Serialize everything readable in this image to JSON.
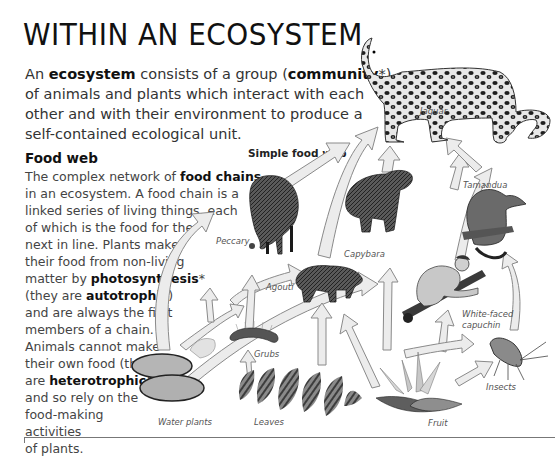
{
  "page": {
    "title": "WITHIN AN ECOSYSTEM",
    "intro": {
      "parts": [
        {
          "text": "An ",
          "bold": false
        },
        {
          "text": "ecosystem",
          "bold": true
        },
        {
          "text": " consists of a group (",
          "bold": false
        },
        {
          "text": "community",
          "bold": true
        },
        {
          "text": "*) of animals and plants which interact with each other and with their environment to produce a self-contained ecological unit.",
          "bold": false
        }
      ],
      "lines": [
        [
          "An ",
          "ecosystem",
          " consists of a group (",
          "community",
          "*)"
        ],
        [
          "of animals and plants which interact with each"
        ],
        [
          "other and with their environment to produce a"
        ],
        [
          "self-contained ecological unit."
        ]
      ]
    },
    "food_web_section": {
      "heading": "Food web",
      "lines": [
        [
          "The complex network of ",
          "food chains",
          ""
        ],
        [
          "in an ecosystem. A food chain is a",
          "",
          ""
        ],
        [
          "linked series of living things, each",
          "",
          ""
        ],
        [
          "of which is the food for the",
          "",
          ""
        ],
        [
          "next in line. Plants make",
          "",
          ""
        ],
        [
          "their food from non-living",
          "",
          ""
        ],
        [
          "matter by ",
          "photosynthesis",
          "*"
        ],
        [
          "(they are ",
          "autotrophic",
          ")"
        ],
        [
          "and are always the first",
          "",
          ""
        ],
        [
          "members of a chain.",
          "",
          ""
        ],
        [
          "Animals cannot make",
          "",
          ""
        ],
        [
          "their own food (they",
          "",
          ""
        ],
        [
          "are ",
          "heterotrophic",
          ")"
        ],
        [
          "and so rely on the",
          "",
          ""
        ],
        [
          "food-making",
          "",
          ""
        ],
        [
          "activities",
          "",
          ""
        ],
        [
          "of plants.",
          "",
          ""
        ]
      ]
    },
    "diagram": {
      "title": "Simple food web",
      "labels": {
        "jaguar": "Jaguar",
        "peccary": "Peccary",
        "capybara": "Capybara",
        "tamandua": "Tamandua",
        "agouti": "Agouti",
        "capuchin_1": "White-faced",
        "capuchin_2": "capuchin",
        "grubs": "Grubs",
        "insects": "Insects",
        "water_plants": "Water plants",
        "leaves": "Leaves",
        "fruit": "Fruit"
      },
      "colors": {
        "arrow_fill": "#ececec",
        "arrow_stroke": "#8a8a8a",
        "animal_dark": "#2b2b2b",
        "animal_mid": "#6b6b6b",
        "plant": "#7a7a7a"
      }
    }
  }
}
